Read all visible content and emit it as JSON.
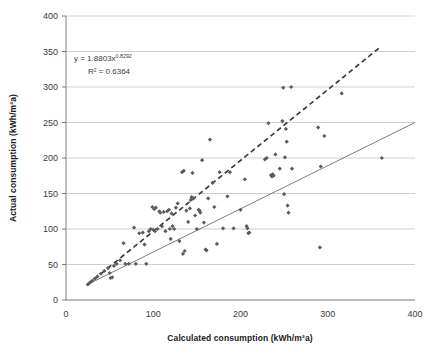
{
  "chart_data": {
    "type": "scatter",
    "title": "",
    "xlabel": "Calculated consumption (kWh/m²a)",
    "ylabel": "Actual consumption (kWh/m²a)",
    "xlim": [
      0,
      400
    ],
    "ylim": [
      0,
      400
    ],
    "xticks": [
      0,
      100,
      200,
      300,
      400
    ],
    "yticks": [
      0,
      50,
      100,
      150,
      200,
      250,
      300,
      350,
      400
    ],
    "grid": "horizontal",
    "legend": "none",
    "marker": "diamond",
    "marker_color": "#595b60",
    "annotations": [
      {
        "name": "regression-equation",
        "text": "y = 1.8803x",
        "superscript": "0.8292",
        "x": 55,
        "y": 332
      },
      {
        "name": "r-squared",
        "text": "R² = 0.6364",
        "x": 72,
        "y": 313
      }
    ],
    "trendlines": [
      {
        "name": "power-fit-dashed",
        "style": "dashed",
        "color": "#3a3c40",
        "x_start": 25,
        "y_start": 22,
        "x_end": 360,
        "y_end": 356
      },
      {
        "name": "linear-fit-solid",
        "style": "solid",
        "color": "#6b6e72",
        "x_start": 25,
        "y_start": 22,
        "x_end": 400,
        "y_end": 250
      }
    ],
    "points": [
      [
        25,
        22
      ],
      [
        27,
        24
      ],
      [
        30,
        27
      ],
      [
        33,
        30
      ],
      [
        36,
        33
      ],
      [
        40,
        37
      ],
      [
        44,
        41
      ],
      [
        48,
        45
      ],
      [
        50,
        38
      ],
      [
        51,
        31
      ],
      [
        53,
        32
      ],
      [
        55,
        48
      ],
      [
        58,
        51
      ],
      [
        62,
        56
      ],
      [
        66,
        80
      ],
      [
        68,
        51
      ],
      [
        72,
        51
      ],
      [
        78,
        102
      ],
      [
        80,
        51
      ],
      [
        84,
        94
      ],
      [
        88,
        95
      ],
      [
        90,
        78
      ],
      [
        92,
        51
      ],
      [
        95,
        97
      ],
      [
        97,
        100
      ],
      [
        99,
        131
      ],
      [
        100,
        99
      ],
      [
        101,
        128
      ],
      [
        102,
        97
      ],
      [
        103,
        130
      ],
      [
        105,
        100
      ],
      [
        107,
        125
      ],
      [
        108,
        123
      ],
      [
        110,
        104
      ],
      [
        112,
        124
      ],
      [
        114,
        97
      ],
      [
        116,
        125
      ],
      [
        118,
        127
      ],
      [
        119,
        100
      ],
      [
        120,
        86
      ],
      [
        121,
        122
      ],
      [
        122,
        104
      ],
      [
        124,
        100
      ],
      [
        126,
        130
      ],
      [
        128,
        136
      ],
      [
        130,
        83
      ],
      [
        133,
        180
      ],
      [
        134,
        65
      ],
      [
        135,
        182
      ],
      [
        136,
        69
      ],
      [
        138,
        126
      ],
      [
        140,
        110
      ],
      [
        142,
        129
      ],
      [
        143,
        141
      ],
      [
        144,
        145
      ],
      [
        145,
        179
      ],
      [
        146,
        143
      ],
      [
        148,
        119
      ],
      [
        150,
        100
      ],
      [
        152,
        127
      ],
      [
        153,
        126
      ],
      [
        154,
        123
      ],
      [
        156,
        197
      ],
      [
        158,
        109
      ],
      [
        160,
        71
      ],
      [
        161,
        70
      ],
      [
        163,
        143
      ],
      [
        165,
        226
      ],
      [
        168,
        165
      ],
      [
        170,
        131
      ],
      [
        173,
        79
      ],
      [
        176,
        180
      ],
      [
        180,
        101
      ],
      [
        185,
        146
      ],
      [
        188,
        180
      ],
      [
        192,
        101
      ],
      [
        200,
        127
      ],
      [
        205,
        170
      ],
      [
        207,
        104
      ],
      [
        208,
        101
      ],
      [
        209,
        94
      ],
      [
        210,
        95
      ],
      [
        228,
        198
      ],
      [
        230,
        200
      ],
      [
        232,
        249
      ],
      [
        235,
        176
      ],
      [
        236,
        174
      ],
      [
        237,
        177
      ],
      [
        238,
        175
      ],
      [
        240,
        205
      ],
      [
        245,
        185
      ],
      [
        248,
        252
      ],
      [
        249,
        299
      ],
      [
        250,
        149
      ],
      [
        251,
        201
      ],
      [
        252,
        241
      ],
      [
        253,
        223
      ],
      [
        254,
        133
      ],
      [
        255,
        123
      ],
      [
        258,
        300
      ],
      [
        259,
        185
      ],
      [
        289,
        243
      ],
      [
        291,
        74
      ],
      [
        292,
        188
      ],
      [
        296,
        231
      ],
      [
        316,
        291
      ],
      [
        362,
        200
      ]
    ]
  }
}
